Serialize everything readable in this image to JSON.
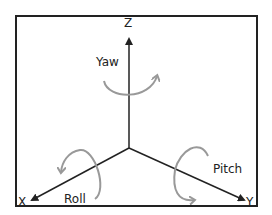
{
  "diagram": {
    "axes": [
      {
        "name": "Z",
        "label": "Z"
      },
      {
        "name": "X",
        "label": "X"
      },
      {
        "name": "Y",
        "label": "Y"
      }
    ],
    "rotations": [
      {
        "name": "yaw",
        "label": "Yaw",
        "axis": "Z"
      },
      {
        "name": "roll",
        "label": "Roll",
        "axis": "X"
      },
      {
        "name": "pitch",
        "label": "Pitch",
        "axis": "Y"
      }
    ],
    "colors": {
      "axis": "#222222",
      "rotation": "#999999",
      "border": "#222222"
    }
  }
}
